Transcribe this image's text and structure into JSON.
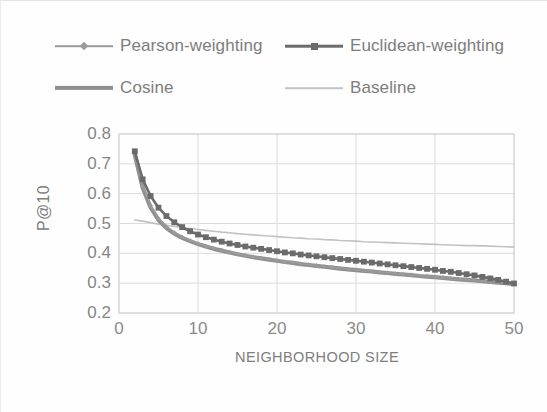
{
  "chart_data": {
    "type": "line",
    "title": "",
    "xlabel": "NEIGHBORHOOD SIZE",
    "ylabel": "P@10",
    "xlim": [
      0,
      50
    ],
    "ylim": [
      0.2,
      0.8
    ],
    "xticks": [
      "0",
      "10",
      "20",
      "30",
      "40",
      "50"
    ],
    "xtick_values": [
      0,
      10,
      20,
      30,
      40,
      50
    ],
    "yticks": [
      "0.2",
      "0.3",
      "0.4",
      "0.5",
      "0.6",
      "0.7",
      "0.8"
    ],
    "ytick_values": [
      0.2,
      0.3,
      0.4,
      0.5,
      0.6,
      0.7,
      0.8
    ],
    "grid": true,
    "legend_position": "top",
    "x": [
      2,
      3,
      4,
      5,
      6,
      7,
      8,
      9,
      10,
      11,
      12,
      13,
      14,
      15,
      16,
      17,
      18,
      19,
      20,
      21,
      22,
      23,
      24,
      25,
      26,
      27,
      28,
      29,
      30,
      31,
      32,
      33,
      34,
      35,
      36,
      37,
      38,
      39,
      40,
      41,
      42,
      43,
      44,
      45,
      46,
      47,
      48,
      49,
      50
    ],
    "series": [
      {
        "name": "Pearson-weighting",
        "color": "#9a9a9a",
        "marker": "diamond",
        "values": [
          0.735,
          0.627,
          0.56,
          0.517,
          0.489,
          0.47,
          0.455,
          0.443,
          0.433,
          0.424,
          0.417,
          0.41,
          0.404,
          0.398,
          0.393,
          0.388,
          0.384,
          0.38,
          0.376,
          0.372,
          0.369,
          0.365,
          0.362,
          0.359,
          0.356,
          0.353,
          0.35,
          0.347,
          0.345,
          0.342,
          0.34,
          0.337,
          0.335,
          0.332,
          0.33,
          0.328,
          0.325,
          0.323,
          0.321,
          0.319,
          0.316,
          0.314,
          0.312,
          0.31,
          0.308,
          0.305,
          0.303,
          0.301,
          0.298
        ]
      },
      {
        "name": "Euclidean-weighting",
        "color": "#6b6b6b",
        "marker": "square",
        "values": [
          0.742,
          0.648,
          0.592,
          0.553,
          0.525,
          0.504,
          0.488,
          0.474,
          0.463,
          0.454,
          0.446,
          0.439,
          0.433,
          0.428,
          0.423,
          0.419,
          0.415,
          0.411,
          0.407,
          0.403,
          0.4,
          0.396,
          0.393,
          0.39,
          0.387,
          0.384,
          0.381,
          0.378,
          0.375,
          0.372,
          0.369,
          0.366,
          0.363,
          0.36,
          0.357,
          0.354,
          0.351,
          0.348,
          0.345,
          0.341,
          0.338,
          0.334,
          0.33,
          0.326,
          0.321,
          0.316,
          0.311,
          0.305,
          0.299
        ]
      },
      {
        "name": "Cosine",
        "color": "#8f8f8f",
        "marker": "none",
        "values": [
          0.73,
          0.62,
          0.554,
          0.512,
          0.485,
          0.466,
          0.452,
          0.441,
          0.431,
          0.423,
          0.415,
          0.409,
          0.403,
          0.397,
          0.392,
          0.387,
          0.383,
          0.379,
          0.375,
          0.371,
          0.368,
          0.364,
          0.361,
          0.358,
          0.355,
          0.352,
          0.349,
          0.346,
          0.344,
          0.341,
          0.339,
          0.336,
          0.334,
          0.331,
          0.329,
          0.327,
          0.324,
          0.322,
          0.32,
          0.318,
          0.315,
          0.313,
          0.311,
          0.309,
          0.307,
          0.304,
          0.302,
          0.3,
          0.297
        ]
      },
      {
        "name": "Baseline",
        "color": "#c2c2c2",
        "marker": "none",
        "values": [
          0.512,
          0.508,
          0.503,
          0.498,
          0.494,
          0.49,
          0.486,
          0.483,
          0.48,
          0.477,
          0.474,
          0.471,
          0.469,
          0.466,
          0.464,
          0.462,
          0.46,
          0.458,
          0.456,
          0.454,
          0.452,
          0.451,
          0.449,
          0.448,
          0.446,
          0.445,
          0.443,
          0.442,
          0.441,
          0.439,
          0.438,
          0.437,
          0.436,
          0.435,
          0.434,
          0.433,
          0.432,
          0.431,
          0.43,
          0.429,
          0.428,
          0.427,
          0.426,
          0.426,
          0.425,
          0.424,
          0.423,
          0.422,
          0.421
        ]
      }
    ]
  },
  "legend": {
    "items": [
      {
        "label": "Pearson-weighting",
        "color": "#9a9a9a",
        "marker": "diamond",
        "line_width": 1.6
      },
      {
        "label": "Euclidean-weighting",
        "color": "#6b6b6b",
        "marker": "square",
        "line_width": 2.6
      },
      {
        "label": "Cosine",
        "color": "#8f8f8f",
        "marker": "none",
        "line_width": 4.2
      },
      {
        "label": "Baseline",
        "color": "#c2c2c2",
        "marker": "none",
        "line_width": 1.6
      }
    ]
  },
  "axes": {
    "y_label": "P@10",
    "x_label": "NEIGHBORHOOD SIZE",
    "y_ticks": [
      "0.8",
      "0.7",
      "0.6",
      "0.5",
      "0.4",
      "0.3",
      "0.2"
    ],
    "x_ticks": [
      "0",
      "10",
      "20",
      "30",
      "40",
      "50"
    ]
  },
  "style": {
    "grid_color": "#dcdcdc",
    "frame_color": "#d4d4d4",
    "text_color": "#808080",
    "background": "#fefefe"
  }
}
